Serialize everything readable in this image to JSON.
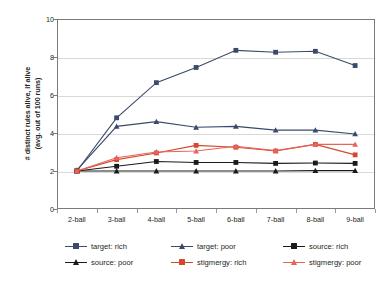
{
  "chart_data": {
    "type": "line",
    "title": "",
    "xlabel": "",
    "ylabel": "# distinct rules alive, if alive (avg. out of 100 runs)",
    "ylabel_line1": "# distinct rules alive, if alive",
    "ylabel_line2": "(avg. out of 100 runs)",
    "categories": [
      "2-ball",
      "3-ball",
      "4-ball",
      "5-ball",
      "6-ball",
      "7-ball",
      "8-ball",
      "9-ball"
    ],
    "ylim": [
      0,
      10
    ],
    "yticks": [
      0,
      2,
      4,
      6,
      8,
      10
    ],
    "grid": true,
    "legend_position": "bottom",
    "series": [
      {
        "name": "target: rich",
        "color": "#3b4a6b",
        "marker": "square",
        "values": [
          2.0,
          4.8,
          6.65,
          7.45,
          8.35,
          8.25,
          8.3,
          7.55
        ]
      },
      {
        "name": "target: poor",
        "color": "#3b4a6b",
        "marker": "triangle",
        "values": [
          2.05,
          4.35,
          4.6,
          4.3,
          4.35,
          4.15,
          4.15,
          3.95
        ]
      },
      {
        "name": "source: rich",
        "color": "#1a1a1a",
        "marker": "square",
        "values": [
          2.0,
          2.25,
          2.5,
          2.45,
          2.45,
          2.4,
          2.42,
          2.4
        ]
      },
      {
        "name": "source: poor",
        "color": "#1a1a1a",
        "marker": "triangle",
        "values": [
          2.0,
          2.0,
          2.0,
          2.0,
          2.0,
          2.0,
          2.02,
          2.02
        ]
      },
      {
        "name": "stigmergy: rich",
        "color": "#d1492f",
        "marker": "square",
        "values": [
          2.0,
          2.6,
          2.95,
          3.35,
          3.25,
          3.05,
          3.4,
          2.85
        ]
      },
      {
        "name": "stigmergy: poor",
        "color": "#e8635a",
        "marker": "triangle",
        "values": [
          2.0,
          2.7,
          3.0,
          3.05,
          3.3,
          3.08,
          3.4,
          3.4
        ]
      }
    ]
  }
}
